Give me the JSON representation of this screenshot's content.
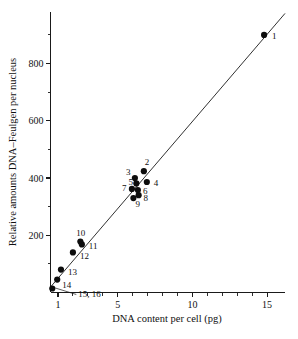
{
  "figure": {
    "background_color": "#ffffff",
    "ink_color": "#111111"
  },
  "axes": {
    "x": {
      "title": "DNA content per cell (pg)",
      "tick_labels": [
        "1",
        "5",
        "10",
        "15"
      ],
      "tick_values": [
        1,
        5,
        10,
        15
      ],
      "minor_tick_values": [
        2,
        3,
        4,
        6,
        7,
        8,
        9,
        11,
        12,
        13,
        14
      ],
      "range": [
        0.5,
        16.2
      ]
    },
    "y": {
      "title": "Relative amounts DNA–Feulgen per nucleus",
      "tick_labels": [
        "200",
        "400",
        "600",
        "800"
      ],
      "tick_values": [
        200,
        400,
        600,
        800
      ],
      "minor_tick_values": [
        100,
        300,
        500,
        700,
        900
      ],
      "range": [
        0,
        980
      ]
    }
  },
  "caption_partial": "",
  "chart_data": {
    "type": "scatter",
    "title": "",
    "xlabel": "DNA content per cell (pg)",
    "ylabel": "Relative amounts DNA–Feulgen per nucleus",
    "xlim": [
      0.5,
      16.2
    ],
    "ylim": [
      0,
      980
    ],
    "grid": false,
    "legend": "none",
    "x_scale": "linear",
    "y_scale": "linear",
    "x_ticks": [
      1,
      5,
      10,
      15
    ],
    "y_ticks": [
      200,
      400,
      600,
      800
    ],
    "x_minor_ticks": [
      2,
      3,
      4,
      6,
      7,
      8,
      9,
      11,
      12,
      13,
      14
    ],
    "y_minor_ticks": [
      100,
      300,
      500,
      700,
      900
    ],
    "fit_line": {
      "description": "straight regression line through origin",
      "x": [
        0.55,
        16.2
      ],
      "y": [
        22,
        975
      ]
    },
    "points": [
      {
        "label": "1",
        "x": 14.8,
        "y": 900,
        "label_dx": 8,
        "label_dy": 4
      },
      {
        "label": "2",
        "x": 6.75,
        "y": 424,
        "label_dx": 1,
        "label_dy": -6
      },
      {
        "label": "3",
        "x": 6.15,
        "y": 400,
        "label_dx": -9,
        "label_dy": -3
      },
      {
        "label": "4",
        "x": 6.95,
        "y": 386,
        "label_dx": 7,
        "label_dy": 4
      },
      {
        "label": "5",
        "x": 6.25,
        "y": 381,
        "label_dx": -8,
        "label_dy": 2
      },
      {
        "label": "6",
        "x": 6.35,
        "y": 358,
        "label_dx": 5,
        "label_dy": 4
      },
      {
        "label": "7",
        "x": 5.95,
        "y": 362,
        "label_dx": -10,
        "label_dy": 2
      },
      {
        "label": "8",
        "x": 6.4,
        "y": 340,
        "label_dx": 5,
        "label_dy": 6
      },
      {
        "label": "9",
        "x": 6.05,
        "y": 330,
        "label_dx": 2,
        "label_dy": 9
      },
      {
        "label": "10",
        "x": 2.5,
        "y": 178,
        "label_dx": -4,
        "label_dy": -6
      },
      {
        "label": "11",
        "x": 2.6,
        "y": 168,
        "label_dx": 7,
        "label_dy": 5
      },
      {
        "label": "12",
        "x": 2.0,
        "y": 140,
        "label_dx": 7,
        "label_dy": 7
      },
      {
        "label": "13",
        "x": 1.2,
        "y": 80,
        "label_dx": 7,
        "label_dy": 5
      },
      {
        "label": "14",
        "x": 0.95,
        "y": 45,
        "label_dx": 5,
        "label_dy": 8
      },
      {
        "label": "15, 16",
        "x": 0.62,
        "y": 14,
        "label_dx": 26,
        "label_dy": 9,
        "leader": true
      }
    ],
    "point_count": 16
  }
}
